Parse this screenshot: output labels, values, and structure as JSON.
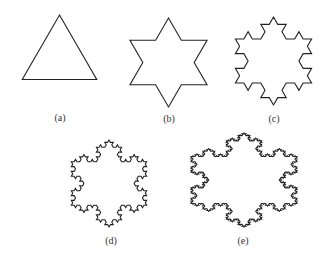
{
  "figure": {
    "stroke_color": "#222222",
    "panels": [
      {
        "id": "a",
        "label": "(a)",
        "iteration": 0,
        "cx": 59.5,
        "cy": 58,
        "radius": 43,
        "xscale": 1.0,
        "label_x": 60,
        "label_y": 121
      },
      {
        "id": "b",
        "label": "(b)",
        "iteration": 1,
        "cx": 168.5,
        "cy": 62.5,
        "radius": 44.5,
        "xscale": 1.0,
        "label_x": 169,
        "label_y": 122
      },
      {
        "id": "c",
        "label": "(c)",
        "iteration": 2,
        "cx": 273.5,
        "cy": 61,
        "radius": 44,
        "xscale": 1.0,
        "label_x": 274,
        "label_y": 122
      },
      {
        "id": "d",
        "label": "(d)",
        "iteration": 3,
        "cx": 109,
        "cy": 183.5,
        "radius": 43.5,
        "xscale": 1.0,
        "label_x": 111,
        "label_y": 244
      },
      {
        "id": "e",
        "label": "(e)",
        "iteration": 4,
        "cx": 244,
        "cy": 180,
        "radius": 47,
        "xscale": 1.3,
        "label_x": 243,
        "label_y": 244
      }
    ]
  }
}
